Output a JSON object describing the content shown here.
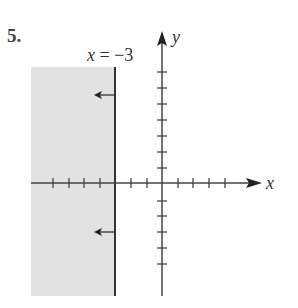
{
  "problem_number": "5.",
  "boundary_label": "x = −3",
  "boundary_label_parts": {
    "var": "x",
    "eq": " = −3"
  },
  "axes": {
    "x_label": "x",
    "y_label": "y"
  },
  "graph": {
    "type": "inequality-region",
    "boundary": "x = -3",
    "shaded_side": "left",
    "shade_color": "#e2e2e2",
    "line_color": "#333333",
    "x_ticks": [
      -8,
      -7,
      -6,
      -5,
      -4,
      -3,
      -2,
      -1,
      1,
      2,
      3,
      4
    ],
    "y_ticks_positive": [
      1,
      2,
      3,
      4,
      5,
      6,
      7
    ],
    "y_ticks_negative": [
      -1,
      -2,
      -3,
      -4,
      -5
    ]
  }
}
